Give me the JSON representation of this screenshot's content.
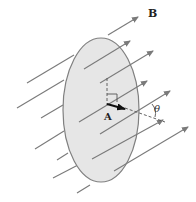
{
  "diagram": {
    "labels": {
      "field": "B",
      "area_vector": "A",
      "angle": "θ"
    },
    "colors": {
      "surface_fill": "#e6e6e6",
      "surface_stroke": "#808080",
      "field_line": "#7a7a7a",
      "area_vector": "#111111",
      "dashed": "#555555"
    },
    "surface": {
      "cx": 101,
      "cy": 110,
      "rx": 38,
      "ry": 72
    },
    "field_lines": [
      {
        "x1": 27,
        "y1": 83,
        "x2": 138,
        "y2": 17,
        "arrow": true
      },
      {
        "x1": 17,
        "y1": 108,
        "x2": 130,
        "y2": 41,
        "arrow": true
      },
      {
        "x1": 41,
        "y1": 118,
        "x2": 153,
        "y2": 51,
        "arrow": true
      },
      {
        "x1": 35,
        "y1": 149,
        "x2": 147,
        "y2": 81,
        "arrow": true
      },
      {
        "x1": 57,
        "y1": 160,
        "x2": 170,
        "y2": 91,
        "arrow": true
      },
      {
        "x1": 53,
        "y1": 178,
        "x2": 163,
        "y2": 120,
        "arrow": true
      },
      {
        "x1": 77,
        "y1": 193,
        "x2": 188,
        "y2": 127,
        "arrow": true
      }
    ]
  }
}
